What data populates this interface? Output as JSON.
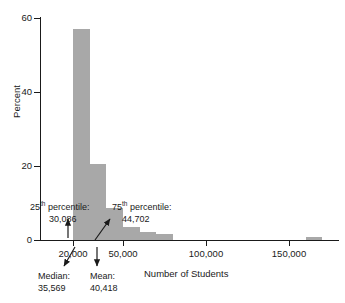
{
  "chart_data": {
    "type": "bar",
    "title": "",
    "subtitle": "",
    "xlabel": "Number of Students",
    "ylabel": "Percent",
    "xlim": [
      0,
      180000
    ],
    "ylim": [
      0,
      62
    ],
    "grid": false,
    "legend": false,
    "bar_color": "#a8a8a8",
    "axis_color": "#1a1a1a",
    "background": "#ffffff",
    "x_ticks": [
      {
        "value": 20000,
        "label": "20,000"
      },
      {
        "value": 50000,
        "label": "50,000"
      },
      {
        "value": 100000,
        "label": "100,000"
      },
      {
        "value": 150000,
        "label": "150,000"
      }
    ],
    "y_ticks": [
      {
        "value": 0,
        "label": "0"
      },
      {
        "value": 20,
        "label": "20"
      },
      {
        "value": 40,
        "label": "40"
      },
      {
        "value": 60,
        "label": "60"
      }
    ],
    "bin_width": 10000,
    "bins": [
      {
        "x_start": 20000,
        "x_end": 30000,
        "percent": 57.0
      },
      {
        "x_start": 30000,
        "x_end": 40000,
        "percent": 20.6
      },
      {
        "x_start": 40000,
        "x_end": 50000,
        "percent": 8.6
      },
      {
        "x_start": 50000,
        "x_end": 60000,
        "percent": 3.6
      },
      {
        "x_start": 60000,
        "x_end": 70000,
        "percent": 2.2
      },
      {
        "x_start": 70000,
        "x_end": 80000,
        "percent": 1.5
      },
      {
        "x_start": 160000,
        "x_end": 170000,
        "percent": 0.7
      }
    ],
    "annotations": [
      {
        "id": "p25",
        "label_line1": "25",
        "label_sup": "th",
        "label_line1_rest": " percentile:",
        "value": "30,086",
        "points_to_x": 30086
      },
      {
        "id": "p75",
        "label_line1": "75",
        "label_sup": "th",
        "label_line1_rest": " percentile:",
        "value": "44,702",
        "points_to_x": 44702
      },
      {
        "id": "median",
        "label_line1": "Median:",
        "value": "35,569",
        "points_to_x": 35569
      },
      {
        "id": "mean",
        "label_line1": "Mean:",
        "value": "40,418",
        "points_to_x": 40418
      }
    ]
  }
}
